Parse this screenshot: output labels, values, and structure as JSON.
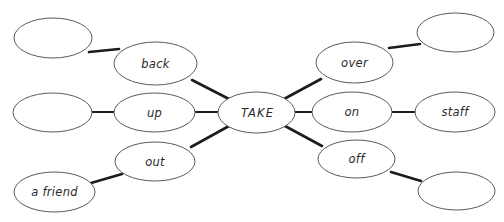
{
  "diagram": {
    "type": "mind-map",
    "background_color": "#ffffff",
    "node_stroke_color": "#5a5a5a",
    "connector_color": "#1c1c1c",
    "text_color": "#2a2a2a",
    "center": {
      "id": "take",
      "label": "TAKE",
      "cx": 256.5,
      "cy": 112.5,
      "rx": 38.5,
      "ry": 20.5
    },
    "nodes": [
      {
        "id": "back",
        "label": "back",
        "cx": 155.5,
        "cy": 63.5,
        "rx": 41.5,
        "ry": 21.5,
        "row": "upper-left",
        "has_label": true
      },
      {
        "id": "back-object",
        "label": "",
        "cx": 53.0,
        "cy": 38.0,
        "rx": 39.0,
        "ry": 20.0,
        "row": "upper-left",
        "has_label": false
      },
      {
        "id": "up",
        "label": "up",
        "cx": 154.5,
        "cy": 112.5,
        "rx": 40.5,
        "ry": 19.5,
        "row": "middle-left",
        "has_label": true
      },
      {
        "id": "up-object",
        "label": "",
        "cx": 52.5,
        "cy": 112.5,
        "rx": 39.5,
        "ry": 19.5,
        "row": "middle-left",
        "has_label": false
      },
      {
        "id": "out",
        "label": "out",
        "cx": 155.0,
        "cy": 161.5,
        "rx": 40.0,
        "ry": 19.5,
        "row": "lower-left",
        "has_label": true
      },
      {
        "id": "out-object",
        "label": "a friend",
        "cx": 54.5,
        "cy": 192.0,
        "rx": 40.5,
        "ry": 20.0,
        "row": "lower-left",
        "has_label": true
      },
      {
        "id": "over",
        "label": "over",
        "cx": 354.5,
        "cy": 62.5,
        "rx": 38.5,
        "ry": 20.5,
        "row": "upper-right",
        "has_label": true
      },
      {
        "id": "over-object",
        "label": "",
        "cx": 455.5,
        "cy": 32.5,
        "rx": 38.5,
        "ry": 19.5,
        "row": "upper-right",
        "has_label": false
      },
      {
        "id": "on",
        "label": "on",
        "cx": 352.0,
        "cy": 112.0,
        "rx": 40.0,
        "ry": 20.0,
        "row": "middle-right",
        "has_label": true
      },
      {
        "id": "on-object",
        "label": "staff",
        "cx": 455.0,
        "cy": 112.0,
        "rx": 40.0,
        "ry": 20.0,
        "row": "middle-right",
        "has_label": true
      },
      {
        "id": "off",
        "label": "off",
        "cx": 356.5,
        "cy": 159.0,
        "rx": 38.5,
        "ry": 19.0,
        "row": "lower-right",
        "has_label": true
      },
      {
        "id": "off-object",
        "label": "",
        "cx": 456.5,
        "cy": 191.0,
        "rx": 38.5,
        "ry": 19.0,
        "row": "lower-right",
        "has_label": false
      }
    ],
    "connectors": [
      {
        "id": "conn-take-back",
        "from": "take",
        "to": "back",
        "x1": 229,
        "y1": 99,
        "x2": 192,
        "y2": 80,
        "style": "diagonal"
      },
      {
        "id": "conn-back-obj",
        "from": "back",
        "to": "back-object",
        "x1": 119,
        "y1": 49,
        "x2": 89,
        "y2": 52,
        "style": "diagonal"
      },
      {
        "id": "conn-take-up",
        "from": "take",
        "to": "up",
        "x1": 218,
        "y1": 112,
        "x2": 195,
        "y2": 112,
        "style": "horizontal"
      },
      {
        "id": "conn-up-obj",
        "from": "up",
        "to": "up-object",
        "x1": 114,
        "y1": 112,
        "x2": 92,
        "y2": 112,
        "style": "horizontal"
      },
      {
        "id": "conn-take-out",
        "from": "take",
        "to": "out",
        "x1": 229,
        "y1": 126,
        "x2": 191,
        "y2": 147,
        "style": "diagonal"
      },
      {
        "id": "conn-out-obj",
        "from": "out",
        "to": "out-object",
        "x1": 122,
        "y1": 174,
        "x2": 91,
        "y2": 183,
        "style": "diagonal"
      },
      {
        "id": "conn-take-over",
        "from": "take",
        "to": "over",
        "x1": 284,
        "y1": 99,
        "x2": 321,
        "y2": 79,
        "style": "diagonal"
      },
      {
        "id": "conn-over-obj",
        "from": "over",
        "to": "over-object",
        "x1": 389,
        "y1": 48,
        "x2": 420,
        "y2": 44,
        "style": "diagonal"
      },
      {
        "id": "conn-take-on",
        "from": "take",
        "to": "on",
        "x1": 295,
        "y1": 112,
        "x2": 312,
        "y2": 112,
        "style": "horizontal"
      },
      {
        "id": "conn-on-obj",
        "from": "on",
        "to": "on-object",
        "x1": 392,
        "y1": 112,
        "x2": 415,
        "y2": 112,
        "style": "horizontal"
      },
      {
        "id": "conn-take-off",
        "from": "take",
        "to": "off",
        "x1": 285,
        "y1": 126,
        "x2": 322,
        "y2": 146,
        "style": "diagonal"
      },
      {
        "id": "conn-off-obj",
        "from": "off",
        "to": "off-object",
        "x1": 391,
        "y1": 172,
        "x2": 421,
        "y2": 181,
        "style": "diagonal"
      }
    ]
  }
}
